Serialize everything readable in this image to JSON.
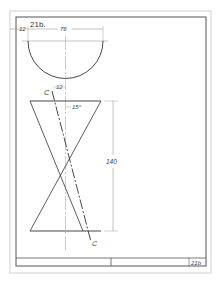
{
  "drawing": {
    "problem_number": "21b.",
    "title_block_number": "21b",
    "dimensions": {
      "left_margin": "12",
      "semicircle_width": "76",
      "offset": "12",
      "angle": "15°",
      "cone_height": "140"
    },
    "cutting_plane": {
      "label_top": "C",
      "label_bottom": "C"
    },
    "views": [
      "semicircle-top-view",
      "double-cone-front-view"
    ]
  },
  "colors": {
    "paper": "#ffffff",
    "line": "#333333",
    "border": "#555555",
    "outer_border": "#cccccc",
    "dimension": "#888888"
  }
}
